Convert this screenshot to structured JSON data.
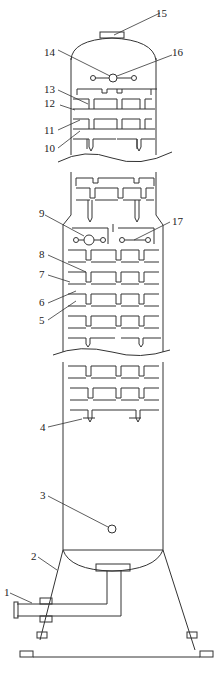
{
  "labels": {
    "l1": "1",
    "l2": "2",
    "l3": "3",
    "l4": "4",
    "l5": "5",
    "l6": "6",
    "l7": "7",
    "l8": "8",
    "l9": "9",
    "l10": "10",
    "l11": "11",
    "l12": "12",
    "l13": "13",
    "l14": "14",
    "l15": "15",
    "l16": "16",
    "l17": "17"
  },
  "colors": {
    "line": "#333333",
    "background": "#ffffff"
  }
}
